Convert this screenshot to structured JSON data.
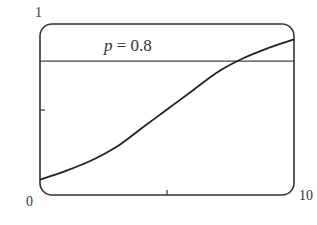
{
  "chart_data": {
    "type": "line",
    "title": "",
    "xlabel": "",
    "ylabel": "",
    "xlim": [
      0,
      10
    ],
    "ylim": [
      0,
      1
    ],
    "grid": false,
    "legend": null,
    "tick_labels": {
      "x_min": "0",
      "x_max": "10",
      "y_max": "1"
    },
    "ticks": {
      "x": [
        5
      ],
      "y": [
        0.5
      ]
    },
    "series": [
      {
        "name": "logistic curve",
        "x": [
          0,
          1,
          2,
          3,
          4,
          5,
          6,
          7,
          8,
          9,
          10
        ],
        "y": [
          0.09,
          0.14,
          0.2,
          0.28,
          0.39,
          0.5,
          0.61,
          0.72,
          0.8,
          0.86,
          0.91
        ]
      },
      {
        "name": "p = 0.8",
        "x": [
          0,
          10
        ],
        "y": [
          0.8,
          0.8
        ]
      }
    ],
    "annotations": [
      {
        "text": "p = 0.8",
        "x": 3.0,
        "y": 0.88
      }
    ]
  },
  "labels": {
    "y_max": "1",
    "origin": "0",
    "x_max": "10",
    "annotation_var": "p",
    "annotation_eq": " = 0.8"
  },
  "colors": {
    "frame": "#333333",
    "curve": "#222222",
    "hline": "#444444"
  }
}
